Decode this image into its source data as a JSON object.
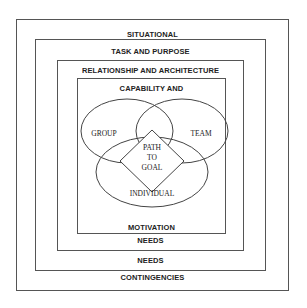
{
  "diagram": {
    "layers": [
      {
        "top_label": "SITUATIONAL",
        "bottom_label": "CONTINGENCIES"
      },
      {
        "top_label": "TASK AND PURPOSE",
        "bottom_label": "NEEDS"
      },
      {
        "top_label": "RELATIONSHIP AND ARCHITECTURE",
        "bottom_label": "NEEDS"
      },
      {
        "top_label": "CAPABILITY AND",
        "bottom_label": "MOTIVATION"
      }
    ],
    "venn": {
      "circles": [
        "GROUP",
        "TEAM",
        "INDIVIDUAL"
      ],
      "center": [
        "PATH",
        "TO",
        "GOAL"
      ]
    },
    "colors": {
      "line": "#555555",
      "text": "#222222",
      "background": "#ffffff"
    }
  }
}
